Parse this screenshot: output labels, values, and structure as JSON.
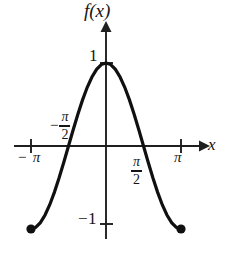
{
  "figure": {
    "background_color": "#ffffff",
    "ink_color": "#101010"
  },
  "labels": {
    "function_label": "f(x)",
    "x_axis_label": "x",
    "y_tick_positive_one": "1",
    "y_tick_negative_one": "−1",
    "x_tick_neg_pi": "− π",
    "x_tick_pi": "π",
    "neg_half_pi_sign": "−",
    "neg_half_pi_numerator": "π",
    "neg_half_pi_denominator": "2",
    "half_pi_numerator": "π",
    "half_pi_denominator": "2"
  },
  "chart_data": {
    "type": "line",
    "title": "",
    "xlabel": "x",
    "ylabel": "f(x)",
    "xlim": [
      -3.14159,
      3.14159
    ],
    "ylim": [
      -1,
      1
    ],
    "grid": false,
    "legend": null,
    "xticks": [
      -3.14159,
      -1.5708,
      1.5708,
      3.14159
    ],
    "xtick_labels": [
      "− π",
      "−π/2",
      "π/2",
      "π"
    ],
    "yticks": [
      -1,
      1
    ],
    "ytick_labels": [
      "−1",
      "1"
    ],
    "series": [
      {
        "name": "f(x) = cos(x)",
        "x": [
          -3.14159,
          -2.9452,
          -2.7489,
          -2.5525,
          -2.3562,
          -2.1598,
          -1.9635,
          -1.7671,
          -1.5708,
          -1.3744,
          -1.1781,
          -0.9817,
          -0.7854,
          -0.589,
          -0.3927,
          -0.1963,
          0,
          0.1963,
          0.3927,
          0.589,
          0.7854,
          0.9817,
          1.1781,
          1.3744,
          1.5708,
          1.7671,
          1.9635,
          2.1598,
          2.3562,
          2.5525,
          2.7489,
          2.9452,
          3.14159
        ],
        "y": [
          -1,
          -0.9808,
          -0.9239,
          -0.8315,
          -0.7071,
          -0.5556,
          -0.3827,
          -0.1951,
          0,
          0.1951,
          0.3827,
          0.5556,
          0.7071,
          0.8315,
          0.9239,
          0.9808,
          1,
          0.9808,
          0.9239,
          0.8315,
          0.7071,
          0.5556,
          0.3827,
          0.1951,
          0,
          -0.1951,
          -0.3827,
          -0.5556,
          -0.7071,
          -0.8315,
          -0.9239,
          -0.9808,
          -1
        ]
      }
    ],
    "endpoints": [
      {
        "x": -3.14159,
        "y": -1,
        "marker": "filled-circle"
      },
      {
        "x": 3.14159,
        "y": -1,
        "marker": "filled-circle"
      }
    ],
    "zero_crossings": [
      -1.5708,
      1.5708
    ],
    "maximum": {
      "x": 0,
      "y": 1
    },
    "annotations": []
  }
}
